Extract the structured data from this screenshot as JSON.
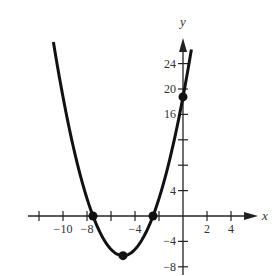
{
  "chart_data": {
    "type": "line",
    "title": "",
    "xlabel": "x",
    "ylabel": "y",
    "function": "f(x) = x^2 + 10x + 18.75",
    "xlim": [
      -12.5,
      6.8
    ],
    "ylim": [
      -9,
      30
    ],
    "grid": false,
    "legend": null,
    "x_ticks": [
      -12,
      -10,
      -8,
      -6,
      -4,
      -2,
      2,
      4
    ],
    "x_tick_labels": [
      {
        "value": -10,
        "label": "−10"
      },
      {
        "value": -8,
        "label": "−8"
      },
      {
        "value": -4,
        "label": "−4"
      },
      {
        "value": 2,
        "label": "2"
      },
      {
        "value": 4,
        "label": "4"
      }
    ],
    "y_ticks": [
      -8,
      -4,
      4,
      8,
      12,
      16,
      20,
      24
    ],
    "y_tick_labels": [
      {
        "value": 24,
        "label": "24"
      },
      {
        "value": 20,
        "label": "20"
      },
      {
        "value": 16,
        "label": "16"
      },
      {
        "value": 4,
        "label": "4"
      },
      {
        "value": -4,
        "label": "−4"
      },
      {
        "value": -8,
        "label": "−8"
      }
    ],
    "series": [
      {
        "name": "parabola",
        "x": [
          -10.8,
          -10,
          -9,
          -8,
          -7.5,
          -7,
          -6,
          -5,
          -4,
          -3,
          -2.5,
          -2,
          -1,
          0,
          0.7
        ],
        "y": [
          21.4,
          18.75,
          12.75,
          8.75,
          0,
          -2.25,
          -5.25,
          -6.25,
          -5.25,
          -2.25,
          0,
          2.75,
          9.75,
          18.75,
          26.2
        ]
      }
    ],
    "marked_points": [
      {
        "x": -7.5,
        "y": 0,
        "label": "x-intercept"
      },
      {
        "x": -2.5,
        "y": 0,
        "label": "x-intercept"
      },
      {
        "x": -5,
        "y": -6.25,
        "label": "vertex"
      },
      {
        "x": 0,
        "y": 18.75,
        "label": "y-intercept"
      }
    ],
    "colors": {
      "curve": "#111111",
      "axes": "#222222",
      "text": "#333333"
    }
  },
  "labels": {
    "x_axis": "x",
    "y_axis": "y"
  }
}
